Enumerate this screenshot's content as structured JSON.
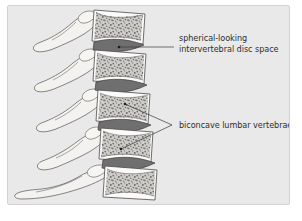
{
  "figure": {
    "kind": "medical-illustration",
    "panel": {
      "background_color": "#e9e9e9",
      "border_color": "#d2d2d2"
    },
    "page_background_color": "#ffffff"
  },
  "annotations": [
    {
      "id": "disc-space",
      "lines": [
        "spherical-looking",
        "intervertebral disc space"
      ],
      "line1": "spherical-looking",
      "line2": "intervertebral disc space",
      "text_color": "#2e2e2e",
      "leader_color": "#3a3a3a",
      "leader_style": "single-horizontal-with-dot",
      "points_to": "intervertebral disc space"
    },
    {
      "id": "biconcave-vertebrae",
      "lines": [
        "biconcave lumbar vertebrae"
      ],
      "line1": "biconcave lumbar vertebrae",
      "text_color": "#2e2e2e",
      "leader_color": "#3a3a3a",
      "leader_style": "branching-v-with-two-dots",
      "points_to": "biconcave lumbar vertebral bodies"
    }
  ],
  "anatomy": {
    "vertebrae_count": 5,
    "disc_count": 4,
    "bone_fill_color": "#f4f2ee",
    "bone_outline_color": "#5d5d5d",
    "vertebral_body_fill_color": "#fbfaf8",
    "trabecular_color": "#4f4f4f",
    "disc_fill_color": "#6f6f6f",
    "disc_outline_color": "#3d3d3d",
    "parts": [
      "vertebral body",
      "intervertebral disc space",
      "spinous process",
      "transverse process",
      "articular process",
      "pedicle"
    ]
  }
}
